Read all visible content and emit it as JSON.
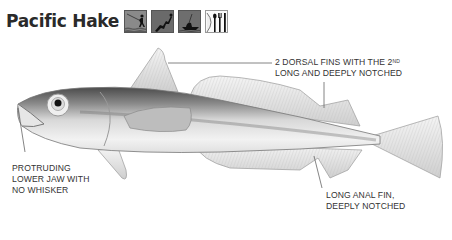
{
  "title": "Pacific Hake",
  "icons": [
    {
      "name": "angling-icon",
      "description": "angler casting from shore"
    },
    {
      "name": "diving-icon",
      "description": "diver"
    },
    {
      "name": "boat-fishing-icon",
      "description": "boat fishing"
    },
    {
      "name": "edible-icon",
      "description": "plate with fork, knife and spoon"
    }
  ],
  "labels": {
    "dorsal_line1": "2 dorsal fins with the 2",
    "dorsal_sup": "nd",
    "dorsal_line2": "long and deeply notched",
    "jaw_line1": "Protruding",
    "jaw_line2": "lower jaw with",
    "jaw_line3": "no whisker",
    "anal_line1": "Long anal fin,",
    "anal_line2": "deeply notched"
  },
  "colors": {
    "title": "#2a2a2a",
    "icon_bg": "#6e6e6e",
    "fish_dark": "#555555",
    "fish_light": "#e8e8e8"
  }
}
